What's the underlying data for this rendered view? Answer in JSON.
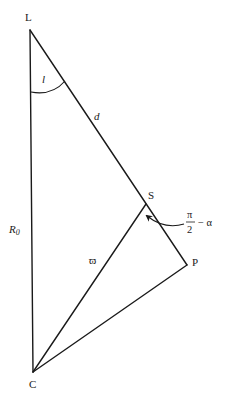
{
  "diagram": {
    "type": "geometry",
    "points": {
      "L": {
        "label": "L",
        "x": 30,
        "y": 30
      },
      "C": {
        "label": "C",
        "x": 33,
        "y": 372
      },
      "S": {
        "label": "S",
        "x": 146,
        "y": 204
      },
      "P": {
        "label": "P",
        "x": 187,
        "y": 265
      }
    },
    "segments": [
      {
        "from": "L",
        "to": "C",
        "label": "R₀"
      },
      {
        "from": "L",
        "to": "P",
        "label": "d"
      },
      {
        "from": "C",
        "to": "S",
        "label": ""
      },
      {
        "from": "C",
        "to": "P",
        "label": ""
      }
    ],
    "labels": {
      "L": "L",
      "C": "C",
      "S": "S",
      "P": "P",
      "angle_l": "l",
      "distance_d": "d",
      "R_main": "R",
      "R_sub": "0",
      "varpi": "ϖ",
      "angle_numerator": "π",
      "angle_denominator": "2",
      "angle_rest": "− α"
    },
    "annotations": {
      "angle_at_L": "l",
      "angle_at_S": "π/2 − α",
      "angle_at_C": "ϖ"
    }
  }
}
